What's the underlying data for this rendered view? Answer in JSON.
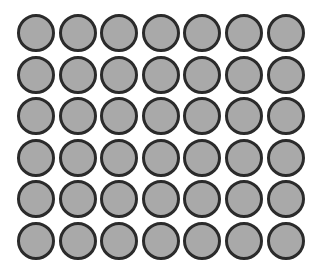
{
  "grid": {
    "rows": 6,
    "columns": 7,
    "count": 42,
    "fill_color": "#a9a9a9",
    "stroke_color": "#2b2b2b"
  }
}
